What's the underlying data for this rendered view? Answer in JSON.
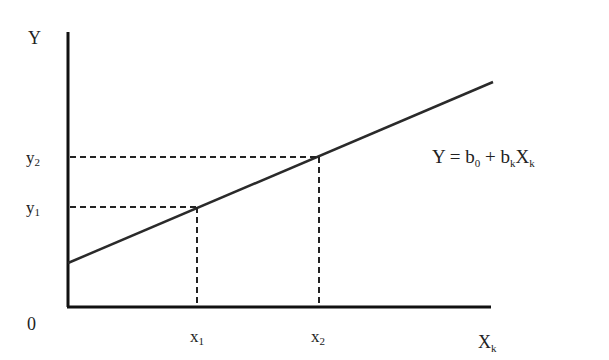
{
  "diagram": {
    "type": "linear-regression-line",
    "y_axis_label": "Y",
    "x_axis_label": "X",
    "x_axis_label_sub": "k",
    "origin_label": "0",
    "y_ticks": [
      {
        "label": "y",
        "sub": "2"
      },
      {
        "label": "y",
        "sub": "1"
      }
    ],
    "x_ticks": [
      {
        "label": "x",
        "sub": "1"
      },
      {
        "label": "x",
        "sub": "2"
      }
    ],
    "equation": {
      "lhs": "Y = b",
      "b0_sub": "0",
      "plus": " + b",
      "bk_sub": "k",
      "x": "X",
      "x_sub": "k"
    },
    "colors": {
      "line": "#2a2a2a",
      "axis": "#111111",
      "dashed": "#222222"
    }
  }
}
